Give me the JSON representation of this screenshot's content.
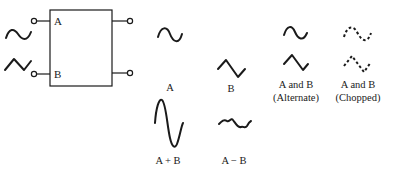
{
  "diagram": {
    "title": "",
    "block": {
      "inputs": [
        {
          "label": "A",
          "signal": "sine-wave"
        },
        {
          "label": "B",
          "signal": "triangle-wave"
        }
      ],
      "outputs": 2
    },
    "displays": [
      {
        "label": "A",
        "signal": "sine-wave"
      },
      {
        "label": "B",
        "signal": "triangle-wave"
      },
      {
        "label": "A and B",
        "sublabel": "(Alternate)",
        "signals": [
          "sine-wave",
          "triangle-wave"
        ],
        "style": "solid"
      },
      {
        "label": "A and B",
        "sublabel": "(Chopped)",
        "signals": [
          "sine-wave",
          "triangle-wave"
        ],
        "style": "dashed"
      },
      {
        "label": "A + B",
        "signal": "large-sum-wave"
      },
      {
        "label": "A − B",
        "signal": "small-difference-wave"
      }
    ]
  },
  "colors": {
    "ink": "#1a1a1a",
    "background": "#ffffff"
  }
}
